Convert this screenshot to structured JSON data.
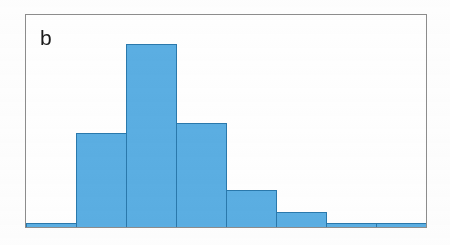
{
  "figure": {
    "panel_label": "b",
    "background_color": "#ffffff",
    "frame_color": "#8d8d8d"
  },
  "chart_data": {
    "type": "bar",
    "title": "b",
    "xlabel": "",
    "ylabel": "",
    "categories": [
      "1",
      "2",
      "3",
      "4",
      "5",
      "6",
      "7",
      "8"
    ],
    "values": [
      1.5,
      44,
      86,
      49,
      17,
      7,
      1.5,
      1.5
    ],
    "ylim": [
      0,
      100
    ],
    "xlim": [
      0,
      8
    ],
    "grid": false,
    "legend": null,
    "bar_color": "#5bafe3",
    "bar_edge_color": "#2a79ad",
    "bar_gap": 0
  }
}
